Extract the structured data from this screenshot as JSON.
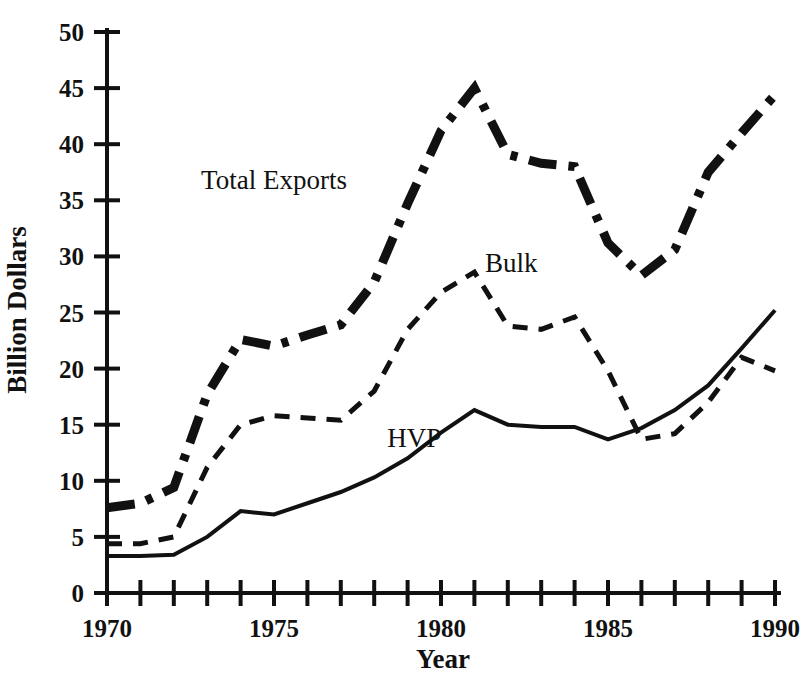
{
  "chart_data": {
    "type": "line",
    "title": "",
    "xlabel": "Year",
    "ylabel": "Billion Dollars",
    "xlim": [
      1970,
      1990
    ],
    "ylim": [
      0,
      50
    ],
    "grid": false,
    "legend_position": "inline-annotations",
    "x": [
      1970,
      1971,
      1972,
      1973,
      1974,
      1975,
      1976,
      1977,
      1978,
      1979,
      1980,
      1981,
      1982,
      1983,
      1984,
      1985,
      1986,
      1987,
      1988,
      1989,
      1990
    ],
    "xticks": [
      1970,
      1971,
      1972,
      1973,
      1974,
      1975,
      1976,
      1977,
      1978,
      1979,
      1980,
      1981,
      1982,
      1983,
      1984,
      1985,
      1986,
      1987,
      1988,
      1989,
      1990
    ],
    "xtick_labels": [
      "1970",
      "",
      "",
      "",
      "",
      "1975",
      "",
      "",
      "",
      "",
      "1980",
      "",
      "",
      "",
      "",
      "1985",
      "",
      "",
      "",
      "",
      "1990"
    ],
    "yticks": [
      0,
      5,
      10,
      15,
      20,
      25,
      30,
      35,
      40,
      45,
      50
    ],
    "ytick_labels": [
      "0",
      "5",
      "10",
      "15",
      "20",
      "25",
      "30",
      "35",
      "40",
      "45",
      "50"
    ],
    "series": [
      {
        "name": "Total Exports",
        "style": "dash-dot",
        "label_text": "Total Exports",
        "label_x": 1975.0,
        "label_y": 36.0,
        "values": [
          7.6,
          8.0,
          9.4,
          17.7,
          22.6,
          22.0,
          23.0,
          23.9,
          27.7,
          34.7,
          41.2,
          45.0,
          39.1,
          38.3,
          38.0,
          31.2,
          28.3,
          30.6,
          37.5,
          41.0,
          44.4
        ]
      },
      {
        "name": "Bulk",
        "style": "dashed",
        "label_text": "Bulk",
        "label_x": 1982.1,
        "label_y": 28.6,
        "values": [
          4.4,
          4.4,
          5.0,
          11.2,
          15.0,
          15.8,
          15.6,
          15.4,
          18.0,
          23.5,
          26.8,
          28.6,
          23.8,
          23.5,
          24.6,
          19.8,
          13.7,
          14.2,
          17.0,
          21.0,
          19.8
        ]
      },
      {
        "name": "HVP",
        "style": "solid",
        "label_text": "HVP",
        "label_x": 1979.2,
        "label_y": 13.0,
        "values": [
          3.3,
          3.3,
          3.4,
          5.0,
          7.3,
          7.0,
          8.0,
          9.0,
          10.3,
          12.0,
          14.3,
          16.3,
          15.0,
          14.8,
          14.8,
          13.7,
          14.7,
          16.3,
          18.5,
          21.8,
          25.2
        ]
      }
    ]
  },
  "axis": {
    "y_title": "Billion Dollars",
    "x_title": "Year"
  }
}
